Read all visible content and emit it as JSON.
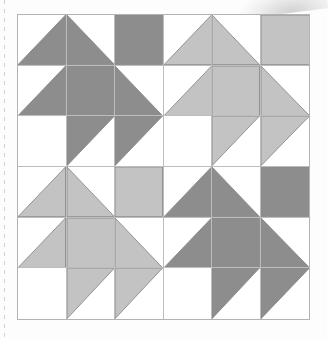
{
  "figure": {
    "name": "quilt-block-pattern",
    "kind": "quilt-layout-diagram",
    "grid_columns": 6,
    "grid_rows": 6,
    "block_columns": 2,
    "block_rows": 2,
    "block_size_cells": 3
  },
  "colors": {
    "background": "#fdfdfd",
    "patch_white": "#ffffff",
    "patch_dark_gray": "#8d8d8d",
    "patch_light_gray": "#c3c3c3",
    "grid_line": "#bdbdbd",
    "frame_line": "#b3b3b3",
    "patch_outline": "#8a8a8a",
    "page_edge_dash": "#c9c9c9"
  },
  "shades": {
    "dark": "dark-gray",
    "light": "light-gray",
    "empty": "white"
  },
  "blocks": [
    {
      "position": "top-left",
      "row": 0,
      "col": 0,
      "shade": "dark-gray"
    },
    {
      "position": "top-right",
      "row": 0,
      "col": 1,
      "shade": "light-gray"
    },
    {
      "position": "bottom-left",
      "row": 1,
      "col": 0,
      "shade": "light-gray"
    },
    {
      "position": "bottom-right",
      "row": 1,
      "col": 1,
      "shade": "dark-gray"
    }
  ],
  "block_template": {
    "name": "tree-bird-block",
    "cells": [
      {
        "r": 0,
        "c": 0,
        "shape": "triangle-bottom-right"
      },
      {
        "r": 0,
        "c": 1,
        "shape": "triangle-bottom-left"
      },
      {
        "r": 0,
        "c": 2,
        "shape": "square-full"
      },
      {
        "r": 1,
        "c": 0,
        "shape": "triangle-bottom-right"
      },
      {
        "r": 1,
        "c": 1,
        "shape": "square-full"
      },
      {
        "r": 1,
        "c": 2,
        "shape": "triangle-bottom-left"
      },
      {
        "r": 2,
        "c": 0,
        "shape": "square-empty"
      },
      {
        "r": 2,
        "c": 1,
        "shape": "triangle-top-left"
      },
      {
        "r": 2,
        "c": 2,
        "shape": "triangle-top-left"
      }
    ]
  },
  "cells": [
    {
      "row": 0,
      "col": 0,
      "shape": "triangle-bottom-right",
      "shade": "dark-gray"
    },
    {
      "row": 0,
      "col": 1,
      "shape": "triangle-bottom-left",
      "shade": "dark-gray"
    },
    {
      "row": 0,
      "col": 2,
      "shape": "square-full",
      "shade": "dark-gray"
    },
    {
      "row": 0,
      "col": 3,
      "shape": "triangle-bottom-right",
      "shade": "light-gray"
    },
    {
      "row": 0,
      "col": 4,
      "shape": "triangle-bottom-left",
      "shade": "light-gray"
    },
    {
      "row": 0,
      "col": 5,
      "shape": "square-full",
      "shade": "light-gray"
    },
    {
      "row": 1,
      "col": 0,
      "shape": "triangle-bottom-right",
      "shade": "dark-gray"
    },
    {
      "row": 1,
      "col": 1,
      "shape": "square-full",
      "shade": "dark-gray"
    },
    {
      "row": 1,
      "col": 2,
      "shape": "triangle-bottom-left",
      "shade": "dark-gray"
    },
    {
      "row": 1,
      "col": 3,
      "shape": "triangle-bottom-right",
      "shade": "light-gray"
    },
    {
      "row": 1,
      "col": 4,
      "shape": "square-full",
      "shade": "light-gray"
    },
    {
      "row": 1,
      "col": 5,
      "shape": "triangle-bottom-left",
      "shade": "light-gray"
    },
    {
      "row": 2,
      "col": 0,
      "shape": "square-empty",
      "shade": "white"
    },
    {
      "row": 2,
      "col": 1,
      "shape": "triangle-top-left",
      "shade": "dark-gray"
    },
    {
      "row": 2,
      "col": 2,
      "shape": "triangle-top-left",
      "shade": "dark-gray"
    },
    {
      "row": 2,
      "col": 3,
      "shape": "square-empty",
      "shade": "white"
    },
    {
      "row": 2,
      "col": 4,
      "shape": "triangle-top-left",
      "shade": "light-gray"
    },
    {
      "row": 2,
      "col": 5,
      "shape": "triangle-top-left",
      "shade": "light-gray"
    },
    {
      "row": 3,
      "col": 0,
      "shape": "triangle-bottom-right",
      "shade": "light-gray"
    },
    {
      "row": 3,
      "col": 1,
      "shape": "triangle-bottom-left",
      "shade": "light-gray"
    },
    {
      "row": 3,
      "col": 2,
      "shape": "square-full",
      "shade": "light-gray"
    },
    {
      "row": 3,
      "col": 3,
      "shape": "triangle-bottom-right",
      "shade": "dark-gray"
    },
    {
      "row": 3,
      "col": 4,
      "shape": "triangle-bottom-left",
      "shade": "dark-gray"
    },
    {
      "row": 3,
      "col": 5,
      "shape": "square-full",
      "shade": "dark-gray"
    },
    {
      "row": 4,
      "col": 0,
      "shape": "triangle-bottom-right",
      "shade": "light-gray"
    },
    {
      "row": 4,
      "col": 1,
      "shape": "square-full",
      "shade": "light-gray"
    },
    {
      "row": 4,
      "col": 2,
      "shape": "triangle-bottom-left",
      "shade": "light-gray"
    },
    {
      "row": 4,
      "col": 3,
      "shape": "triangle-bottom-right",
      "shade": "dark-gray"
    },
    {
      "row": 4,
      "col": 4,
      "shape": "square-full",
      "shade": "dark-gray"
    },
    {
      "row": 4,
      "col": 5,
      "shape": "triangle-bottom-left",
      "shade": "dark-gray"
    },
    {
      "row": 5,
      "col": 0,
      "shape": "square-empty",
      "shade": "white"
    },
    {
      "row": 5,
      "col": 1,
      "shape": "triangle-top-left",
      "shade": "light-gray"
    },
    {
      "row": 5,
      "col": 2,
      "shape": "triangle-top-left",
      "shade": "light-gray"
    },
    {
      "row": 5,
      "col": 3,
      "shape": "square-empty",
      "shade": "white"
    },
    {
      "row": 5,
      "col": 4,
      "shape": "triangle-top-left",
      "shade": "dark-gray"
    },
    {
      "row": 5,
      "col": 5,
      "shape": "triangle-top-left",
      "shade": "dark-gray"
    }
  ]
}
